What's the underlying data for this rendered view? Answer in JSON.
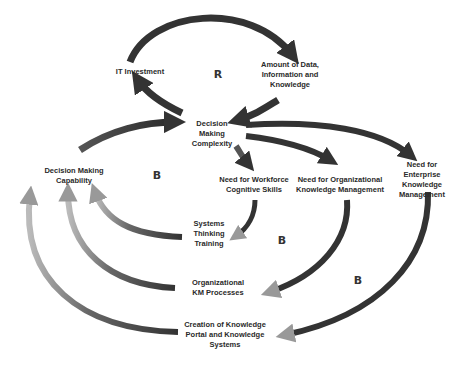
{
  "diagram": {
    "type": "causal loop diagram",
    "nodes": {
      "it_investment": "IT Investment",
      "amount_data": "Amount of Data,\nInformation and\nKnowledge",
      "complexity": "Decision\nMaking\nComplexity",
      "capability": "Decision Making\nCapability",
      "workforce": "Need for Workforce\nCognitive Skills",
      "org_km": "Need for Organizational\nKnowledge Management",
      "enterprise_km": "Need for Enterprise\nKnowledge Management",
      "systems_thinking": "Systems\nThinking\nTraining",
      "org_processes": "Organizational\nKM Processes",
      "portal": "Creation of Knowledge\nPortal and Knowledge\nSystems"
    },
    "loops": {
      "reinforcing": "R",
      "balancing_1": "B",
      "balancing_2": "B",
      "balancing_3": "B"
    },
    "edges": [
      {
        "from": "IT Investment",
        "to": "Amount of Data, Information and Knowledge"
      },
      {
        "from": "Amount of Data, Information and Knowledge",
        "to": "Decision Making Complexity"
      },
      {
        "from": "Decision Making Complexity",
        "to": "IT Investment"
      },
      {
        "from": "Decision Making Capability",
        "to": "Decision Making Complexity"
      },
      {
        "from": "Decision Making Complexity",
        "to": "Need for Workforce Cognitive Skills"
      },
      {
        "from": "Decision Making Complexity",
        "to": "Need for Organizational Knowledge Management"
      },
      {
        "from": "Decision Making Complexity",
        "to": "Need for Enterprise Knowledge Management"
      },
      {
        "from": "Need for Workforce Cognitive Skills",
        "to": "Systems Thinking Training"
      },
      {
        "from": "Need for Organizational Knowledge Management",
        "to": "Organizational KM Processes"
      },
      {
        "from": "Need for Enterprise Knowledge Management",
        "to": "Creation of Knowledge Portal and Knowledge Systems"
      },
      {
        "from": "Systems Thinking Training",
        "to": "Decision Making Capability"
      },
      {
        "from": "Organizational KM Processes",
        "to": "Decision Making Capability"
      },
      {
        "from": "Creation of Knowledge Portal and Knowledge Systems",
        "to": "Decision Making Capability"
      }
    ]
  }
}
